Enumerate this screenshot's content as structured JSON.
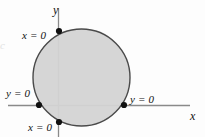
{
  "figure": {
    "background_color": "#fdfdfd",
    "axis_color": "#8a8a8a",
    "curve_color": "#4a4a4a",
    "fill_color": "#d4d4d4",
    "point_color": "#111111",
    "label_color": "#111111",
    "axes": {
      "y_axis_label": "y",
      "x_axis_label": "x"
    },
    "labels": [
      {
        "id": "top-left",
        "text": "x = 0"
      },
      {
        "id": "mid-left",
        "text": "y = 0"
      },
      {
        "id": "right",
        "text": "y = 0"
      },
      {
        "id": "bottom",
        "text": "x = 0"
      }
    ],
    "edge_artifact": {
      "text": "c"
    }
  },
  "chart_data": {
    "type": "scatter",
    "title": "",
    "subtitle": "",
    "xlabel": "x",
    "ylabel": "y",
    "grid": false,
    "legend": null,
    "xlim": [
      -1.5,
      2.7
    ],
    "ylim": [
      -0.65,
      2.0
    ],
    "shapes": [
      {
        "kind": "circle",
        "center_px": [
          81.5,
          77.5
        ],
        "radius_px": 48.5,
        "fill": "#d4d4d4",
        "stroke": "#4a4a4a",
        "stroke_width": 1.4
      }
    ],
    "axes_px": {
      "y_axis_x": 58.5,
      "y_axis_y_start": 8,
      "y_axis_y_end": 137,
      "x_axis_y": 105.5,
      "x_axis_x_start": 8,
      "x_axis_x_end": 190
    },
    "points": [
      {
        "label": "x = 0",
        "x_px": 59,
        "y_px": 31,
        "on": "y-axis",
        "position": "upper-left"
      },
      {
        "label": "y = 0",
        "x_px": 39,
        "y_px": 105,
        "on": "x-axis",
        "position": "left"
      },
      {
        "label": "y = 0",
        "x_px": 124,
        "y_px": 105,
        "on": "x-axis",
        "position": "right"
      },
      {
        "label": "x = 0",
        "x_px": 59,
        "y_px": 122,
        "on": "y-axis",
        "position": "lower"
      }
    ],
    "annotations": [
      {
        "text": "x = 0",
        "x_px": 22,
        "y_px": 30
      },
      {
        "text": "y = 0",
        "x_px": 6,
        "y_px": 88
      },
      {
        "text": "y = 0",
        "x_px": 130,
        "y_px": 94
      },
      {
        "text": "x = 0",
        "x_px": 28,
        "y_px": 122
      },
      {
        "text": "y",
        "x_px": 53,
        "y_px": 4
      },
      {
        "text": "x",
        "x_px": 190,
        "y_px": 110
      }
    ]
  }
}
